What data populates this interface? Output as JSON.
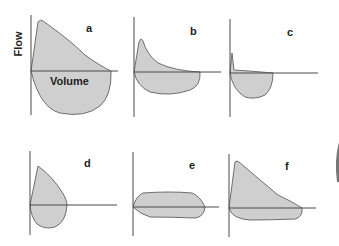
{
  "figure": {
    "y_axis_label": "Flow",
    "x_axis_label": "Volume",
    "panels": [
      {
        "id": "a",
        "label": "a",
        "description": "Normal flow-volume loop: sharp expiratory peak, linear decline, large rounded inspiratory limb"
      },
      {
        "id": "b",
        "label": "b",
        "description": "Obstructive pattern: early peak then concave (scooped) expiratory limb, reduced volume"
      },
      {
        "id": "c",
        "label": "c",
        "description": "Severe obstruction: brief spike then near-zero expiratory flow, small inspiratory limb"
      },
      {
        "id": "d",
        "label": "d",
        "description": "Restrictive pattern: narrow, tall loop with small volume"
      },
      {
        "id": "e",
        "label": "e",
        "description": "Fixed upper airway obstruction: flattened (plateaued) expiratory and inspiratory limbs"
      },
      {
        "id": "f",
        "label": "f",
        "description": "Variable extrathoracic obstruction: preserved expiratory limb, flattened inspiratory limb"
      }
    ]
  },
  "colors": {
    "loop_fill": "#cfcfcf",
    "loop_stroke": "#6e6e6e",
    "axis": "#4a4a4a",
    "text": "#222222"
  }
}
